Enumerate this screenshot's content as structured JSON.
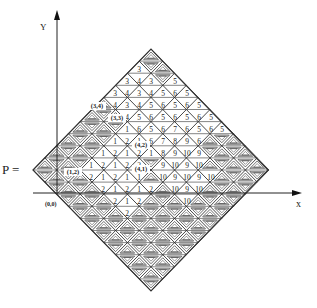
{
  "figure": {
    "y_axis_label": "Y",
    "x_axis_label": "x",
    "p_label": "P =",
    "origin_label": "(0,0)",
    "line_color": "#333333",
    "fill_band_color": "#9a9a9a"
  },
  "geometry": {
    "left": [
      33,
      170
    ],
    "top": [
      151,
      49
    ],
    "right": [
      268,
      170
    ],
    "bottom": [
      151,
      291
    ],
    "n": 10,
    "y_axis": {
      "x": 57,
      "y_top": 10,
      "y_bottom": 193
    },
    "x_axis": {
      "y": 193,
      "x_left": 33,
      "x_right": 302
    }
  },
  "number_rows": [
    {
      "y": 69,
      "cells": [
        [
          139,
          "3"
        ]
      ]
    },
    {
      "y": 81,
      "cells": [
        [
          127,
          "3"
        ],
        [
          139,
          "4"
        ],
        [
          151,
          "3"
        ],
        [
          175,
          "5"
        ]
      ]
    },
    {
      "y": 93,
      "cells": [
        [
          115,
          "3"
        ],
        [
          127,
          "4"
        ],
        [
          139,
          "3"
        ],
        [
          151,
          "4"
        ],
        [
          163,
          "5"
        ],
        [
          175,
          "6"
        ],
        [
          187,
          "5"
        ]
      ]
    },
    {
      "y": 105,
      "cells": [
        [
          115,
          "4"
        ],
        [
          127,
          "3"
        ],
        [
          139,
          "4"
        ],
        [
          151,
          "5"
        ],
        [
          163,
          "6"
        ],
        [
          175,
          "5"
        ],
        [
          187,
          "6"
        ],
        [
          199,
          "5"
        ]
      ]
    },
    {
      "y": 117,
      "cells": [
        [
          127,
          "4"
        ],
        [
          139,
          "5"
        ],
        [
          151,
          "6"
        ],
        [
          163,
          "5"
        ],
        [
          175,
          "6"
        ],
        [
          187,
          "5"
        ],
        [
          199,
          "6"
        ],
        [
          211,
          "5"
        ]
      ]
    },
    {
      "y": 129,
      "cells": [
        [
          127,
          "1"
        ],
        [
          139,
          "6"
        ],
        [
          151,
          "5"
        ],
        [
          163,
          "6"
        ],
        [
          175,
          "7"
        ],
        [
          187,
          "6"
        ],
        [
          199,
          "5"
        ],
        [
          211,
          "6"
        ],
        [
          222,
          "5"
        ]
      ]
    },
    {
      "y": 141,
      "cells": [
        [
          115,
          "1"
        ],
        [
          127,
          "2"
        ],
        [
          139,
          "1"
        ],
        [
          151,
          "6"
        ],
        [
          163,
          "7"
        ],
        [
          175,
          "8"
        ],
        [
          187,
          "9"
        ],
        [
          199,
          "6"
        ]
      ]
    },
    {
      "y": 153,
      "cells": [
        [
          103,
          "1"
        ],
        [
          115,
          "2"
        ],
        [
          127,
          "1"
        ],
        [
          139,
          "2"
        ],
        [
          151,
          "1"
        ],
        [
          163,
          "8"
        ],
        [
          175,
          "9"
        ],
        [
          187,
          "10"
        ],
        [
          199,
          "9"
        ]
      ]
    },
    {
      "y": 165,
      "cells": [
        [
          91,
          "1"
        ],
        [
          103,
          "2"
        ],
        [
          115,
          "1"
        ],
        [
          127,
          "2"
        ],
        [
          139,
          "2"
        ],
        [
          163,
          "9"
        ],
        [
          175,
          "10"
        ],
        [
          187,
          "9"
        ],
        [
          199,
          "10"
        ]
      ]
    },
    {
      "y": 177,
      "cells": [
        [
          91,
          "2"
        ],
        [
          103,
          "1"
        ],
        [
          115,
          "2"
        ],
        [
          127,
          "1"
        ],
        [
          139,
          "1"
        ],
        [
          163,
          "10"
        ],
        [
          175,
          "9"
        ],
        [
          187,
          "10"
        ],
        [
          199,
          "9"
        ],
        [
          211,
          "10"
        ]
      ]
    },
    {
      "y": 189,
      "cells": [
        [
          103,
          "2"
        ],
        [
          115,
          "1"
        ],
        [
          127,
          "2"
        ],
        [
          139,
          "1"
        ],
        [
          151,
          "2"
        ],
        [
          175,
          "10"
        ],
        [
          187,
          "9"
        ],
        [
          199,
          "10"
        ]
      ]
    },
    {
      "y": 201,
      "cells": [
        [
          115,
          "2"
        ],
        [
          127,
          "1"
        ],
        [
          139,
          "2"
        ],
        [
          187,
          "10"
        ]
      ]
    },
    {
      "y": 213,
      "cells": [
        [
          127,
          "2"
        ]
      ]
    }
  ],
  "point_labels": [
    {
      "text": "(3,4)",
      "x": 97,
      "y": 108
    },
    {
      "text": "(3,3)",
      "x": 117,
      "y": 120
    },
    {
      "text": "(4,2)",
      "x": 141,
      "y": 147
    },
    {
      "text": "(4,1)",
      "x": 141,
      "y": 171
    },
    {
      "text": "(1,2)",
      "x": 73,
      "y": 174
    }
  ]
}
